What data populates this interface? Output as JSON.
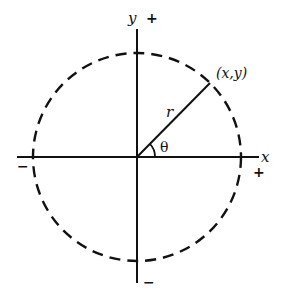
{
  "diagram": {
    "title": "",
    "type": "polar-coordinates-unit-circle",
    "colors": {
      "stroke": "#111111",
      "background": "#ffffff"
    },
    "labels": {
      "y_axis": "y",
      "y_positive": "+",
      "y_negative": "−",
      "x_axis": "x",
      "x_positive": "+",
      "x_negative": "−",
      "point": "(x,y)",
      "radius": "r",
      "angle": "θ"
    },
    "geometry": {
      "origin": [
        137,
        157
      ],
      "circle_radius": 102,
      "circle_style": "dashed",
      "radius_angle_deg": 45
    }
  }
}
